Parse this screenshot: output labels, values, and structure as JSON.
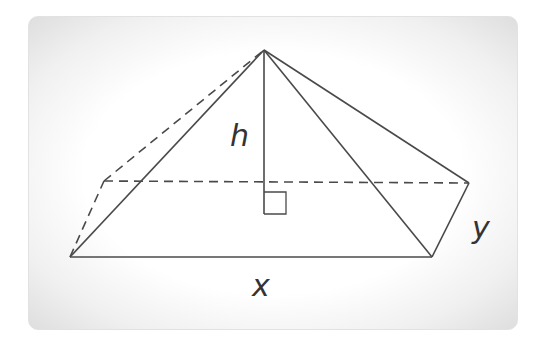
{
  "diagram": {
    "type": "rectangular-pyramid",
    "labels": {
      "height": "h",
      "length": "x",
      "width": "y"
    },
    "colors": {
      "stroke": "#4a4a4a",
      "label": "#333333",
      "panel_edge": "#dedede"
    },
    "vertices": {
      "apex": [
        264,
        50
      ],
      "front_left": [
        70,
        257
      ],
      "front_right": [
        432,
        257
      ],
      "back_right": [
        469,
        183
      ],
      "back_left": [
        104,
        181
      ],
      "height_foot": [
        264,
        214
      ]
    }
  }
}
